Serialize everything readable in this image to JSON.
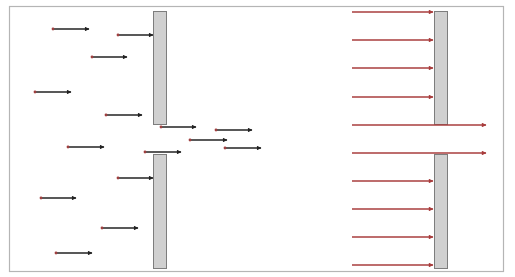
{
  "colors": {
    "frame": "#b5b5b5",
    "barrier_fill": "#d0d0d0",
    "barrier_stroke": "#7d7d7d",
    "particle_arrow": "#222222",
    "particle_dot": "#a04040",
    "wave_arrow": "#a83c3c"
  },
  "frame": {
    "x": 9,
    "y": 6,
    "w": 494,
    "h": 265
  },
  "left_panel": {
    "label": "particles through double slit",
    "barriers": [
      {
        "x": 153,
        "y": 11,
        "w": 13,
        "h": 113
      },
      {
        "x": 153,
        "y": 154,
        "w": 13,
        "h": 114
      }
    ],
    "arrows": [
      {
        "x1": 53,
        "y": 29,
        "x2": 89
      },
      {
        "x1": 118,
        "y": 35,
        "x2": 153
      },
      {
        "x1": 92,
        "y": 57,
        "x2": 127
      },
      {
        "x1": 35,
        "y": 92,
        "x2": 71
      },
      {
        "x1": 106,
        "y": 115,
        "x2": 142
      },
      {
        "x1": 161,
        "y": 127,
        "x2": 196
      },
      {
        "x1": 216,
        "y": 130,
        "x2": 252
      },
      {
        "x1": 190,
        "y": 140,
        "x2": 227
      },
      {
        "x1": 68,
        "y": 147,
        "x2": 104
      },
      {
        "x1": 225,
        "y": 148,
        "x2": 261
      },
      {
        "x1": 145,
        "y": 152,
        "x2": 181
      },
      {
        "x1": 118,
        "y": 178,
        "x2": 153
      },
      {
        "x1": 41,
        "y": 198,
        "x2": 76
      },
      {
        "x1": 102,
        "y": 228,
        "x2": 138
      },
      {
        "x1": 56,
        "y": 253,
        "x2": 92
      }
    ]
  },
  "right_panel": {
    "label": "rays through slit",
    "barriers": [
      {
        "x": 434,
        "y": 11,
        "w": 13,
        "h": 113
      },
      {
        "x": 434,
        "y": 154,
        "w": 13,
        "h": 114
      }
    ],
    "arrows": [
      {
        "x1": 352,
        "y": 12,
        "x2": 433
      },
      {
        "x1": 352,
        "y": 40,
        "x2": 433
      },
      {
        "x1": 352,
        "y": 68,
        "x2": 433
      },
      {
        "x1": 352,
        "y": 97,
        "x2": 433
      },
      {
        "x1": 352,
        "y": 125,
        "x2": 486
      },
      {
        "x1": 352,
        "y": 153,
        "x2": 486
      },
      {
        "x1": 352,
        "y": 181,
        "x2": 433
      },
      {
        "x1": 352,
        "y": 209,
        "x2": 433
      },
      {
        "x1": 352,
        "y": 237,
        "x2": 433
      },
      {
        "x1": 352,
        "y": 265,
        "x2": 433
      }
    ]
  }
}
